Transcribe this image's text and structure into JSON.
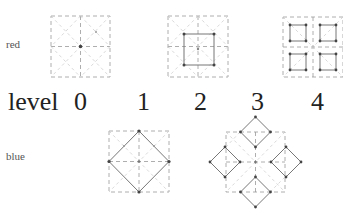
{
  "rows": {
    "top_label": "red",
    "bottom_label": "blue"
  },
  "axis": {
    "title": "level",
    "levels": [
      "0",
      "1",
      "2",
      "3",
      "4"
    ]
  },
  "figures": {
    "red": [
      {
        "level": "0",
        "description": "dashed 2x2 grid with dashed diagonals, center point"
      },
      {
        "level": "2",
        "description": "dashed grid with inner solid square and corner points"
      },
      {
        "level": "4",
        "description": "four small solid squares with corner points in 2x2 grid"
      }
    ],
    "blue": [
      {
        "level": "1",
        "description": "solid diamond inscribed in dashed square grid"
      },
      {
        "level": "3",
        "description": "four solid diamonds around dashed square grid"
      }
    ]
  },
  "colors": {
    "dashed": "#999999",
    "solid": "#777777",
    "point": "#444444",
    "text": "#222222"
  }
}
